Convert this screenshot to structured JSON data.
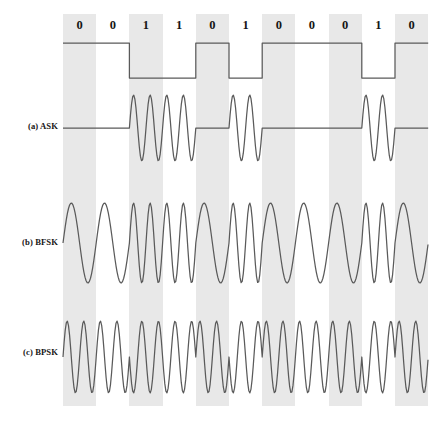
{
  "figure": {
    "bits": [
      "0",
      "0",
      "1",
      "1",
      "0",
      "1",
      "0",
      "0",
      "0",
      "1",
      "0"
    ],
    "rows": [
      {
        "id": "ask",
        "label": "(a) ASK"
      },
      {
        "id": "bfsk",
        "label": "(b) BFSK"
      },
      {
        "id": "bpsk",
        "label": "(c) BPSK"
      }
    ],
    "colors": {
      "band": "#e8e8e8",
      "stroke": "#5a5a5a",
      "text": "#151515",
      "background": "#ffffff"
    }
  },
  "chart_data": {
    "type": "line",
    "xlabel": "",
    "ylabel": "",
    "grid": false,
    "legend": "none",
    "categories": [
      "0",
      "0",
      "1",
      "1",
      "0",
      "1",
      "0",
      "0",
      "0",
      "1",
      "0"
    ],
    "bit_sequence": [
      0,
      0,
      1,
      1,
      0,
      1,
      0,
      0,
      0,
      1,
      0
    ],
    "bit_count": 11,
    "x_start_px": 63,
    "bit_width_px": 33.2,
    "shaded_bit_indices": [
      0,
      2,
      4,
      6,
      8,
      10
    ],
    "series": [
      {
        "name": "digital data (NRZ)",
        "type": "square",
        "description": "High level for bit 0, low level for bit 1",
        "baseline_y_px": 43,
        "low_y_px": 78,
        "values": [
          1,
          1,
          0,
          0,
          1,
          0,
          1,
          1,
          1,
          0,
          1
        ]
      },
      {
        "name": "(a) ASK",
        "type": "amplitude-shift-keying",
        "description": "Carrier present (2 cycles per bit) for bit 1, flat zero line for bit 0",
        "center_y_px": 128,
        "amplitude_px": 33,
        "cycles_per_bit_for_1": 2,
        "cycles_per_bit_for_0": 0,
        "values": [
          0,
          0,
          1,
          1,
          0,
          1,
          0,
          0,
          0,
          1,
          0
        ]
      },
      {
        "name": "(b) BFSK",
        "type": "frequency-shift-keying",
        "description": "1 cycle per bit for bit 0 (low frequency), 2 cycles per bit for bit 1 (high frequency)",
        "center_y_px": 243,
        "amplitude_px": 40,
        "cycles_per_bit_for_0": 1,
        "cycles_per_bit_for_1": 2,
        "values": [
          1,
          1,
          2,
          2,
          1,
          2,
          1,
          1,
          1,
          2,
          1
        ]
      },
      {
        "name": "(c) BPSK",
        "type": "phase-shift-keying",
        "description": "Constant 2 cycles per bit; phase inverted 180 degrees for bit 1 relative to bit 0",
        "center_y_px": 357,
        "amplitude_px": 36,
        "cycles_per_bit": 2,
        "phase_deg": [
          0,
          0,
          180,
          180,
          0,
          180,
          0,
          0,
          0,
          180,
          0
        ]
      }
    ]
  }
}
